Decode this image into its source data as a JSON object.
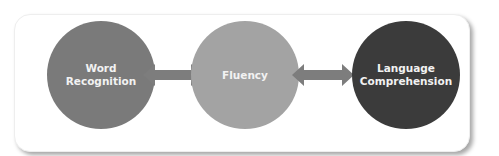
{
  "diagram": {
    "nodes": [
      {
        "id": "word-recognition",
        "label_line1": "Word",
        "label_line2": "Recognition",
        "color": "#7a7a7a"
      },
      {
        "id": "fluency",
        "label_line1": "Fluency",
        "label_line2": "",
        "color": "#a3a3a3"
      },
      {
        "id": "language-comprehension",
        "label_line1": "Language",
        "label_line2": "Comprehension",
        "color": "#3b3b3b"
      }
    ],
    "edges": [
      {
        "from": "word-recognition",
        "to": "fluency",
        "type": "bidirectional",
        "color": "#7d7d7d"
      },
      {
        "from": "fluency",
        "to": "language-comprehension",
        "type": "bidirectional",
        "color": "#7d7d7d"
      }
    ]
  }
}
